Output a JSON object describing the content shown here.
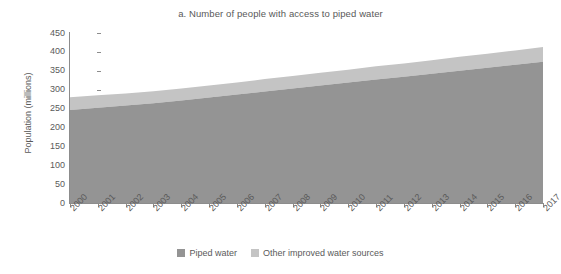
{
  "chart_data": {
    "type": "area",
    "title": "a. Number of people with access to piped water",
    "xlabel": "",
    "ylabel": "Population (millions)",
    "stacked": true,
    "grid": false,
    "legend_position": "bottom",
    "ylim": [
      0,
      450
    ],
    "ytick_labels": [
      "450",
      "400",
      "350",
      "300",
      "250",
      "200",
      "150",
      "100",
      "50",
      "0"
    ],
    "ytick_values": [
      450,
      400,
      350,
      300,
      250,
      200,
      150,
      100,
      50,
      0
    ],
    "categories": [
      "2000",
      "2001",
      "2002",
      "2003",
      "2004",
      "2005",
      "2006",
      "2007",
      "2008",
      "2009",
      "2010",
      "2011",
      "2012",
      "2013",
      "2014",
      "2015",
      "2016",
      "2017"
    ],
    "series": [
      {
        "name": "Piped water",
        "color": "#949494",
        "values": [
          246,
          252,
          258,
          264,
          271,
          279,
          287,
          295,
          303,
          311,
          319,
          327,
          334,
          342,
          350,
          358,
          366,
          374
        ]
      },
      {
        "name": "Other improved water sources",
        "color": "#c4c4c4",
        "values": [
          34,
          33,
          32,
          32,
          32,
          32,
          32,
          33,
          33,
          34,
          34,
          35,
          35,
          36,
          37,
          37,
          38,
          39
        ]
      }
    ],
    "totals": [
      280,
      285,
      290,
      296,
      303,
      311,
      319,
      328,
      336,
      345,
      353,
      362,
      369,
      378,
      387,
      395,
      404,
      413
    ]
  },
  "legend": {
    "items": [
      {
        "label": "Piped water",
        "color": "#949494"
      },
      {
        "label": "Other improved water sources",
        "color": "#c4c4c4"
      }
    ]
  },
  "colors": {
    "piped_water": "#949494",
    "other_improved": "#c4c4c4",
    "axis": "#8c8c8c",
    "text": "#5a5a5a",
    "background": "#ffffff"
  }
}
